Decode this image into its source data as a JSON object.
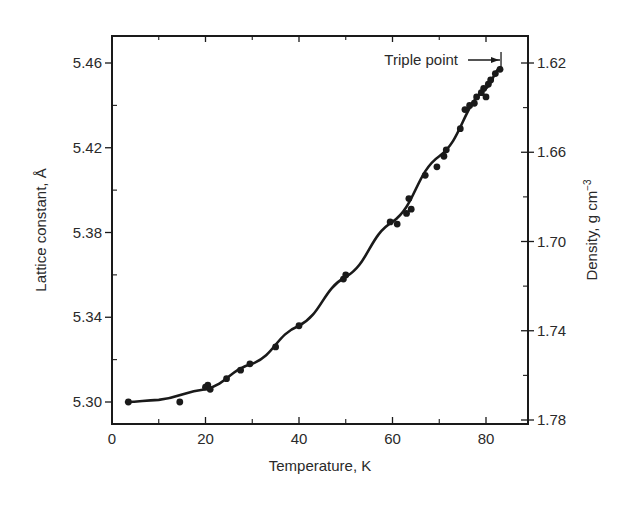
{
  "chart_data": {
    "type": "scatter",
    "title": "",
    "xlabel": "Temperature, K",
    "ylabel": "Lattice constant, Å",
    "y2label": "Density, g cm⁻³",
    "y2label_base": "Density, g cm",
    "y2label_sup": "−3",
    "xlim": [
      0,
      88
    ],
    "ylim": [
      5.29,
      5.47
    ],
    "y2lim": [
      1.78,
      1.62
    ],
    "x_ticks": [
      0,
      20,
      40,
      60,
      80
    ],
    "x_tick_labels": [
      "0",
      "20",
      "40",
      "60",
      "80"
    ],
    "x_minor_ticks": [
      10,
      30,
      50,
      70
    ],
    "y_ticks": [
      5.3,
      5.34,
      5.38,
      5.42,
      5.46
    ],
    "y_tick_labels": [
      "5.30",
      "5.34",
      "5.38",
      "5.42",
      "5.46"
    ],
    "y_minor_ticks": [
      5.32,
      5.36,
      5.4,
      5.44
    ],
    "y2_ticks": [
      1.62,
      1.66,
      1.7,
      1.74,
      1.78
    ],
    "y2_tick_labels": [
      "1.62",
      "1.66",
      "1.70",
      "1.74",
      "1.78"
    ],
    "y2_minor_ticks": [
      1.64,
      1.68,
      1.72,
      1.76
    ],
    "grid": false,
    "legend": null,
    "annotations": [
      {
        "text": "Triple point",
        "x": 83,
        "y": 5.461,
        "arrow": "right"
      }
    ],
    "series": [
      {
        "name": "measured lattice constant",
        "marker": "filled-circle",
        "x": [
          3.5,
          14.5,
          20,
          20.5,
          21,
          24.5,
          27.5,
          29.5,
          35,
          40,
          49.5,
          50,
          59.5,
          61,
          63,
          63.5,
          64,
          67,
          69.5,
          71,
          71.5,
          74.5,
          75.5,
          76.5,
          77.5,
          78,
          79,
          79.5,
          80,
          80.5,
          81,
          82,
          83
        ],
        "y": [
          5.3,
          5.3,
          5.307,
          5.308,
          5.306,
          5.311,
          5.315,
          5.318,
          5.326,
          5.336,
          5.358,
          5.36,
          5.385,
          5.384,
          5.389,
          5.396,
          5.391,
          5.407,
          5.411,
          5.416,
          5.419,
          5.429,
          5.438,
          5.44,
          5.441,
          5.444,
          5.446,
          5.448,
          5.444,
          5.45,
          5.452,
          5.455,
          5.457
        ]
      },
      {
        "name": "fitted curve",
        "style": "solid-line",
        "x": [
          3,
          10,
          20,
          30,
          40,
          50,
          60,
          70,
          80,
          83
        ],
        "y": [
          5.3,
          5.301,
          5.306,
          5.318,
          5.336,
          5.359,
          5.385,
          5.416,
          5.448,
          5.458
        ]
      }
    ]
  },
  "colors": {
    "ink": "#1a1a1a",
    "background": "#ffffff"
  }
}
